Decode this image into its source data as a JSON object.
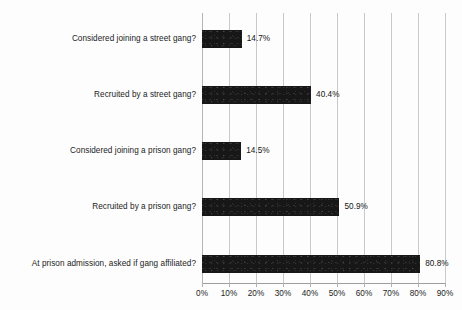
{
  "chart_data": {
    "type": "bar",
    "orientation": "horizontal",
    "title": "",
    "subtitle": "",
    "xlabel": "",
    "ylabel": "",
    "categories": [
      "Considered joining a street gang?",
      "Recruited by a street gang?",
      "Considered joining a prison gang?",
      "Recruited by a prison gang?",
      "At prison admission, asked if gang affiliated?"
    ],
    "values": [
      14.7,
      40.4,
      14.5,
      50.9,
      80.8
    ],
    "value_labels": [
      "14.7%",
      "40.4%",
      "14.5%",
      "50.9%",
      "80.8%"
    ],
    "xlim": [
      0,
      90
    ],
    "xticks": [
      0,
      10,
      20,
      30,
      40,
      50,
      60,
      70,
      80,
      90
    ],
    "xtick_labels": [
      "0%",
      "10%",
      "20%",
      "30%",
      "40%",
      "50%",
      "60%",
      "70%",
      "80%",
      "90%"
    ],
    "grid": true,
    "grid_axis": "x",
    "legend": false,
    "bar_color": "#171717",
    "grid_color": "#c9c9c9",
    "background_color": "#fdfdfd",
    "text_color": "#1c1c1c"
  }
}
